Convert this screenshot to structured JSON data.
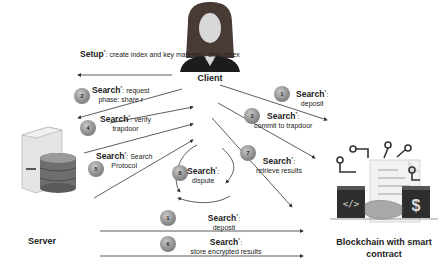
{
  "actors": {
    "client": "Client",
    "server": "Server",
    "blockchain": "Blockchain with smart contract"
  },
  "steps": [
    {
      "id": "setup",
      "badge": "",
      "title": "Setup",
      "desc": "create index and key materials, sign index"
    },
    {
      "id": "2",
      "badge": "2",
      "title": "Search",
      "desc_line1": "request",
      "desc_line2": "phase: share r"
    },
    {
      "id": "4",
      "badge": "4",
      "title": "Search",
      "desc_line1": "verify",
      "desc_line2": "trapdoor"
    },
    {
      "id": "5",
      "badge": "5",
      "title": "Search",
      "desc_line1": "Search",
      "desc_line2": "Protocol"
    },
    {
      "id": "8",
      "badge": "8",
      "title": "Search",
      "desc": "dispute"
    },
    {
      "id": "1a",
      "badge": "1",
      "title": "Search",
      "desc": "deposit"
    },
    {
      "id": "3",
      "badge": "3",
      "title": "Search",
      "desc": "commit to trapdoor"
    },
    {
      "id": "7",
      "badge": "7",
      "title": "Search",
      "desc": "retrieve results"
    },
    {
      "id": "1b",
      "badge": "1",
      "title": "Search",
      "desc": "deposit"
    },
    {
      "id": "6",
      "badge": "6",
      "title": "Search",
      "desc": "store encrypted results"
    }
  ],
  "sup": "*",
  "colors": {
    "line": "#333333",
    "badge": "#8e8e8e",
    "dark": "#2e2e2e"
  }
}
